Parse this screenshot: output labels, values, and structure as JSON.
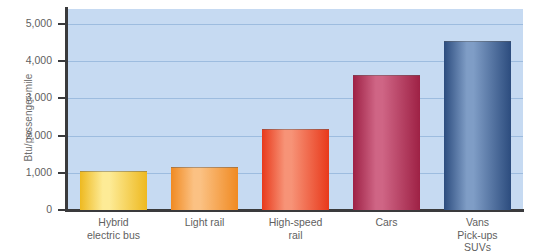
{
  "chart_data": {
    "type": "bar",
    "title": "",
    "xlabel": "",
    "ylabel": "Btu/passenger-mile",
    "categories": [
      "Hybrid\nelectric bus",
      "Light rail",
      "High-speed\nrail",
      "Cars",
      "Vans\nPick-ups\nSUVs"
    ],
    "values": [
      1050,
      1150,
      2180,
      3620,
      4550
    ],
    "ylim": [
      0,
      5400
    ],
    "yticks": [
      0,
      1000,
      2000,
      3000,
      4000,
      5000
    ],
    "ytick_labels": [
      "0",
      "1,000",
      "2,000",
      "3,000",
      "4,000",
      "5,000"
    ],
    "grid": true,
    "legend": "none",
    "colors": {
      "plot_background": "#c6daf2",
      "gridline": "#9dbcdf",
      "axis": "#3a3a3c",
      "text": "#5f5f5f",
      "bar_1_edge": "#eeb920",
      "bar_1_highlight": "#fdeb96",
      "bar_2_edge": "#f08a22",
      "bar_2_highlight": "#fbc183",
      "bar_3_edge": "#e8391b",
      "bar_3_highlight": "#f79377",
      "bar_4_edge": "#9e2145",
      "bar_4_highlight": "#cf6585",
      "bar_5_edge": "#2c4c7e",
      "bar_5_highlight": "#7f9dc6"
    }
  }
}
